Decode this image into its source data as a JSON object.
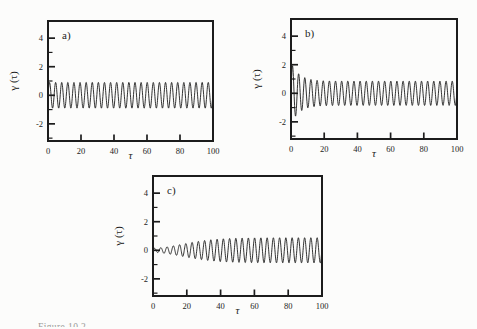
{
  "figure": {
    "ink_color": "#1c1c1c",
    "background_color": "#fcfcfb",
    "caption_partial": "Figure 10.2"
  },
  "chart_data": [
    {
      "id": "a",
      "type": "line",
      "panel_label": "a)",
      "xlabel": "τ",
      "ylabel": "γ (τ)",
      "xlim": [
        0,
        100
      ],
      "ylim": [
        -3.2,
        5.2
      ],
      "xticks": [
        0,
        20,
        40,
        60,
        80,
        100
      ],
      "yticks_major": [
        -2,
        0,
        2,
        4
      ],
      "yticks_minor": [
        -3,
        -1,
        1,
        3
      ],
      "grid": false,
      "legend": false,
      "sample_step": 0.12,
      "series": [
        {
          "name": "gamma",
          "model": "steady",
          "amplitude": 0.9,
          "period": 3.7,
          "phase": 0,
          "description": "constant-amplitude oscillation, ~27 cycles between tau=0 and tau=100, envelope +/-0.9"
        }
      ]
    },
    {
      "id": "b",
      "type": "line",
      "panel_label": "b)",
      "xlabel": "τ",
      "ylabel": "γ (τ)",
      "xlim": [
        0,
        100
      ],
      "ylim": [
        -3.2,
        5.2
      ],
      "xticks": [
        0,
        20,
        40,
        60,
        80,
        100
      ],
      "yticks_major": [
        -2,
        0,
        2,
        4
      ],
      "yticks_minor": [
        -3,
        -1,
        1,
        3
      ],
      "grid": false,
      "legend": false,
      "sample_step": 0.12,
      "series": [
        {
          "name": "gamma",
          "model": "decay",
          "amplitude": 0.85,
          "extra_amplitude": 1.3,
          "decay_constant": 5,
          "period": 3.7,
          "phase": 0,
          "description": "transient oscillation: initial peaks near +/-2 decaying to steady envelope +/-0.9 by tau~15"
        }
      ]
    },
    {
      "id": "c",
      "type": "line",
      "panel_label": "c)",
      "xlabel": "τ",
      "ylabel": "γ (τ)",
      "xlim": [
        0,
        100
      ],
      "ylim": [
        -3.2,
        5.2
      ],
      "xticks": [
        0,
        20,
        40,
        60,
        80,
        100
      ],
      "yticks_major": [
        -2,
        0,
        2,
        4
      ],
      "yticks_minor": [
        -3,
        -1,
        1,
        3
      ],
      "grid": false,
      "legend": false,
      "sample_step": 0.12,
      "series": [
        {
          "name": "gamma",
          "model": "grow",
          "amplitude": 0.88,
          "growth_midpoint": 18,
          "growth_rate": 10,
          "period": 3.7,
          "phase": 0,
          "description": "growing oscillation: tiny amplitude near tau=0 increasing smoothly, saturating near +/-0.9 after tau~45"
        }
      ]
    }
  ]
}
